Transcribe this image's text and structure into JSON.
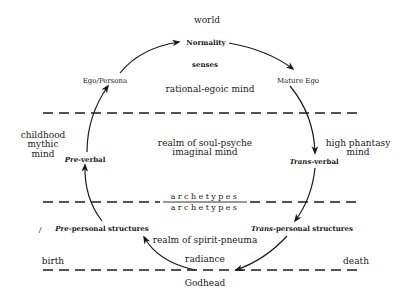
{
  "diagram": {
    "top": {
      "world": "world",
      "normality": "Normality",
      "senses": "senses",
      "ego_persona": "Ego/Persona",
      "mature_ego": "Mature Ego",
      "rational_egoic": "rational-egoic mind"
    },
    "middle": {
      "left_label": [
        "childhood",
        "mythic",
        "mind"
      ],
      "pre_verbal": {
        "prefix": "Pre",
        "suffix": "-verbal"
      },
      "center": [
        "realm of soul-psyche",
        "imaginal mind"
      ],
      "right_label": [
        "high phantasy",
        "mind"
      ],
      "trans_verbal": {
        "prefix": "Trans",
        "suffix": "-verbal"
      }
    },
    "archetypes": {
      "upper": "archetypes",
      "lower": "archetypes"
    },
    "bottom": {
      "pre_personal": {
        "prefix": "Pre",
        "suffix": "-personal structures"
      },
      "trans_personal": {
        "prefix": "Trans",
        "suffix": "-personal structures"
      },
      "spirit": "realm of spirit-pneuma",
      "birth": "birth",
      "radiance": "radiance",
      "death": "death",
      "godhead": "Godhead",
      "stray_mark": "/"
    },
    "colors": {
      "ink": "#1a1a1a",
      "background": "#ffffff"
    }
  }
}
